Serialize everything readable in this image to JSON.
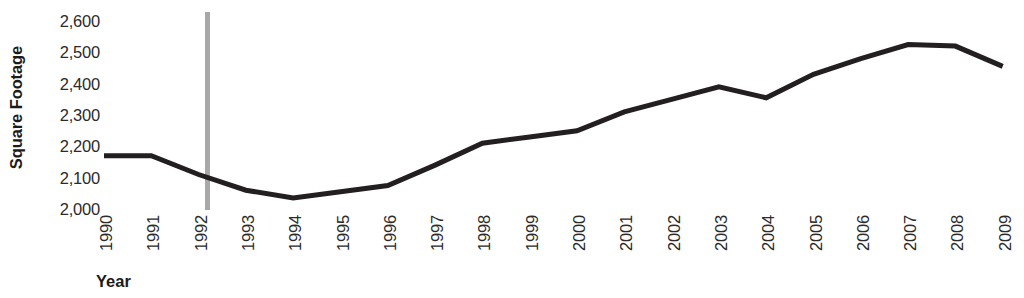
{
  "chart_data": {
    "type": "line",
    "title": "",
    "xlabel": "Year",
    "ylabel": "Square Footage",
    "x": [
      1990,
      1991,
      1992,
      1993,
      1994,
      1995,
      1996,
      1997,
      1998,
      1999,
      2000,
      2001,
      2002,
      2003,
      2004,
      2005,
      2006,
      2007,
      2008,
      2009
    ],
    "categories": [
      "1990",
      "1991",
      "1992",
      "1993",
      "1994",
      "1995",
      "1996",
      "1997",
      "1998",
      "1999",
      "2000",
      "2001",
      "2002",
      "2003",
      "2004",
      "2005",
      "2006",
      "2007",
      "2008",
      "2009"
    ],
    "values": [
      2170,
      2170,
      2110,
      2060,
      2035,
      2055,
      2075,
      2140,
      2210,
      2230,
      2250,
      2310,
      2350,
      2390,
      2355,
      2430,
      2480,
      2525,
      2520,
      2455
    ],
    "series": [
      {
        "name": "Square Footage",
        "values": [
          2170,
          2170,
          2110,
          2060,
          2035,
          2055,
          2075,
          2140,
          2210,
          2230,
          2250,
          2310,
          2350,
          2390,
          2355,
          2430,
          2480,
          2525,
          2520,
          2455
        ],
        "color": "#231f20"
      }
    ],
    "ylim": [
      2000,
      2600
    ],
    "ytick_labels": [
      "2,600",
      "2,500",
      "2,400",
      "2,300",
      "2,200",
      "2,100",
      "2,000"
    ],
    "ytick_values": [
      2600,
      2500,
      2400,
      2300,
      2200,
      2100,
      2000
    ],
    "grid": false,
    "legend": false,
    "legend_position": "none",
    "line_color": "#231f20",
    "axis_color": "#a8a8a8"
  }
}
